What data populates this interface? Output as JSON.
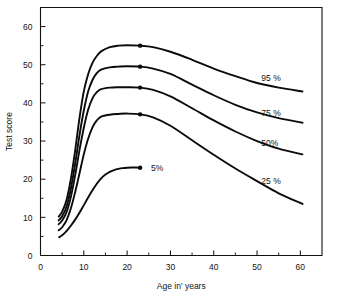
{
  "chart_data": {
    "type": "line",
    "title": "",
    "xlabel": "Age in' years",
    "ylabel": "Test score",
    "xlim": [
      0,
      65
    ],
    "ylim": [
      0,
      65
    ],
    "grid": false,
    "legend_position": "inline-right-of-curves",
    "x_ticks": [
      0,
      10,
      20,
      30,
      40,
      50,
      60
    ],
    "x_tick_labels": [
      "0",
      "10",
      "20",
      "30",
      "40",
      "50",
      "60"
    ],
    "x_minor_ticks": [
      5,
      15,
      25,
      35,
      45,
      55
    ],
    "y_ticks": [
      0,
      10,
      20,
      30,
      40,
      50,
      60
    ],
    "y_tick_labels": [
      "0",
      "10",
      "20",
      "30",
      "40",
      "50",
      "60"
    ],
    "y_minor_ticks": [
      5,
      15,
      25,
      35,
      45,
      55
    ],
    "marker_age": 23,
    "series": [
      {
        "name": "95 %",
        "label": "95 %",
        "peak_age": 23,
        "peak_value": 55,
        "label_x": 51,
        "label_y": 46.5,
        "marker": true,
        "x": [
          4.2,
          5,
          6,
          7,
          8,
          9,
          10,
          11,
          12,
          13,
          14,
          16,
          18,
          20,
          23,
          26,
          30,
          35,
          40,
          45,
          50,
          55,
          60.5
        ],
        "y": [
          10.2,
          11.5,
          14.5,
          20,
          27.5,
          36,
          43,
          47.5,
          50.5,
          52.3,
          53.5,
          54.6,
          55,
          55.1,
          55,
          54.6,
          53.4,
          51.3,
          49,
          47,
          45.2,
          44,
          43
        ]
      },
      {
        "name": "75 %",
        "label": "75 %",
        "peak_age": 23,
        "peak_value": 49.5,
        "label_x": 51,
        "label_y": 37.5,
        "marker": true,
        "x": [
          4.2,
          5,
          6,
          7,
          8,
          9,
          10,
          11,
          12,
          13,
          14,
          16,
          18,
          20,
          23,
          26,
          30,
          35,
          40,
          45,
          50,
          55,
          60.5
        ],
        "y": [
          9.2,
          10.3,
          12.8,
          17.5,
          24,
          31.5,
          38,
          43,
          46,
          47.8,
          48.7,
          49.3,
          49.5,
          49.6,
          49.5,
          49,
          47.6,
          44.8,
          42,
          39.5,
          37.5,
          36,
          34.8
        ]
      },
      {
        "name": "50%",
        "label": "50%",
        "peak_age": 23,
        "peak_value": 44,
        "label_x": 51,
        "label_y": 29.5,
        "marker": true,
        "x": [
          4.2,
          5,
          6,
          7,
          8,
          9,
          10,
          11,
          12,
          13,
          14,
          16,
          18,
          20,
          23,
          26,
          30,
          35,
          40,
          45,
          50,
          55,
          60.5
        ],
        "y": [
          8.2,
          9.2,
          11.3,
          15.3,
          21,
          27.6,
          33.5,
          38.2,
          41.2,
          42.8,
          43.6,
          44,
          44.1,
          44.1,
          44,
          43.4,
          41.7,
          38.6,
          35.4,
          32.5,
          30,
          28,
          26.5
        ]
      },
      {
        "name": "25 %",
        "label": "25 %",
        "peak_age": 23,
        "peak_value": 37,
        "label_x": 51,
        "label_y": 19.5,
        "marker": true,
        "x": [
          4.2,
          5,
          6,
          7,
          8,
          9,
          10,
          11,
          12,
          13,
          14,
          16,
          18,
          20,
          23,
          26,
          30,
          35,
          40,
          45,
          50,
          55,
          60.5
        ],
        "y": [
          6.6,
          7.4,
          9.2,
          12.3,
          16.6,
          21.5,
          26.5,
          30.6,
          33.6,
          35.4,
          36.4,
          36.9,
          37.1,
          37.2,
          37,
          36.2,
          34,
          30.2,
          26.4,
          22.8,
          19.5,
          16.3,
          13.5
        ]
      },
      {
        "name": "5%",
        "label": "5%",
        "peak_age": 23,
        "peak_value": 23,
        "label_x": 25.5,
        "label_y": 23,
        "marker": true,
        "truncated_at_marker": true,
        "x": [
          4.3,
          5,
          6,
          7,
          8,
          9,
          10,
          11,
          12,
          13,
          14,
          15,
          16,
          17,
          18,
          19,
          20,
          21,
          22,
          23
        ],
        "y": [
          4.8,
          5.3,
          6.4,
          7.8,
          9.4,
          11.2,
          13.2,
          15.2,
          17.1,
          18.8,
          20.2,
          21.2,
          21.9,
          22.4,
          22.7,
          22.9,
          23.0,
          23.05,
          23.05,
          23.0
        ]
      }
    ]
  }
}
